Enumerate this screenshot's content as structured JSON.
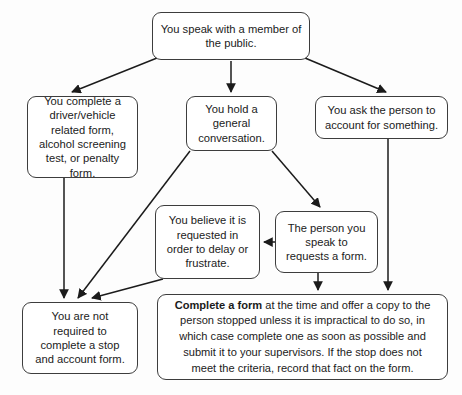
{
  "diagram": {
    "type": "flowchart",
    "background_color": "#fdfdfd",
    "box_border_color": "#3d3d3d",
    "text_color": "#1b1b1b",
    "nodes": {
      "start": {
        "id": "start",
        "text": "You speak with a member of the public."
      },
      "driver_form": {
        "id": "driver_form",
        "text": "You complete a driver/vehicle related form, alcohol screening test, or penalty form."
      },
      "general_conversation": {
        "id": "general_conversation",
        "text": "You hold a general conversation."
      },
      "ask_account": {
        "id": "ask_account",
        "text": "You ask the person to account for something."
      },
      "believe_delay": {
        "id": "believe_delay",
        "text": "You believe it is requested in order to delay or frustrate."
      },
      "requests_form": {
        "id": "requests_form",
        "text": "The person you speak to requests a form."
      },
      "not_required": {
        "id": "not_required",
        "text": "You are not required to complete a stop and account form."
      },
      "complete_form": {
        "id": "complete_form",
        "lead_bold": "Complete a form",
        "rest": " at the time and offer a copy to the person stopped unless it is impractical to do so, in which case complete one as soon as possible and submit it to your supervisors. If the stop does not meet the criteria, record that fact on the form."
      }
    },
    "edges": [
      {
        "from": "start",
        "to": "driver_form",
        "style": "diagonal-arrow"
      },
      {
        "from": "start",
        "to": "general_conversation",
        "style": "vertical-arrow"
      },
      {
        "from": "start",
        "to": "ask_account",
        "style": "diagonal-arrow"
      },
      {
        "from": "driver_form",
        "to": "not_required",
        "style": "vertical-arrow"
      },
      {
        "from": "general_conversation",
        "to": "not_required",
        "style": "diagonal-arrow"
      },
      {
        "from": "general_conversation",
        "to": "requests_form",
        "style": "diagonal-arrow"
      },
      {
        "from": "requests_form",
        "to": "believe_delay",
        "style": "horizontal-arrow-left"
      },
      {
        "from": "believe_delay",
        "to": "not_required",
        "style": "diagonal-arrow"
      },
      {
        "from": "requests_form",
        "to": "complete_form",
        "style": "vertical-arrow"
      },
      {
        "from": "ask_account",
        "to": "complete_form",
        "style": "vertical-arrow"
      }
    ]
  }
}
